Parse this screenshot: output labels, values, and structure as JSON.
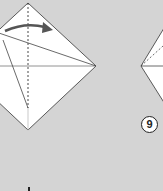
{
  "diagram": {
    "step_label": "9",
    "background_color": "#d4d4d4",
    "paper_color": "#ffffff",
    "line_color": "#333333",
    "arrow_color": "#555555"
  }
}
